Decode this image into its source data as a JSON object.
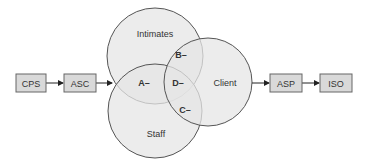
{
  "diagram": {
    "boxes": [
      {
        "id": "cps",
        "label": "CPS"
      },
      {
        "id": "asc",
        "label": "ASC"
      },
      {
        "id": "asp",
        "label": "ASP"
      },
      {
        "id": "iso",
        "label": "ISO"
      }
    ],
    "circles": [
      {
        "id": "intimates",
        "label": "Intimates"
      },
      {
        "id": "client",
        "label": "Client"
      },
      {
        "id": "staff",
        "label": "Staff"
      }
    ],
    "regions": [
      {
        "id": "a",
        "label": "A–"
      },
      {
        "id": "b",
        "label": "B–"
      },
      {
        "id": "c",
        "label": "C–"
      },
      {
        "id": "d",
        "label": "D–"
      }
    ],
    "colors": {
      "box_fill": "#d9d9d9",
      "box_stroke": "#666666",
      "circle_fill": "#e8e8e8",
      "circle_stroke": "#555555",
      "text": "#333333"
    }
  }
}
